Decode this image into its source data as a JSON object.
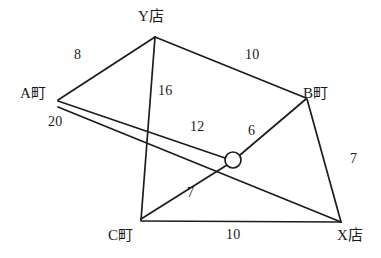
{
  "diagram": {
    "type": "weighted-graph",
    "title": "",
    "background_color": "#ffffff",
    "line_color": "#1c1c1c",
    "nodes": [
      {
        "id": "Y",
        "label": "Y店",
        "x": 155,
        "y": 37,
        "label_x": 138,
        "label_y": 9,
        "shape": "point"
      },
      {
        "id": "A",
        "label": "A町",
        "x": 58,
        "y": 100,
        "label_x": 20,
        "label_y": 86,
        "shape": "point"
      },
      {
        "id": "B",
        "label": "B町",
        "x": 306,
        "y": 98,
        "label_x": 303,
        "label_y": 86,
        "shape": "point"
      },
      {
        "id": "C",
        "label": "C町",
        "x": 141,
        "y": 220,
        "label_x": 108,
        "label_y": 228,
        "shape": "point"
      },
      {
        "id": "X",
        "label": "X店",
        "x": 341,
        "y": 222,
        "label_x": 337,
        "label_y": 228,
        "shape": "point"
      },
      {
        "id": "J",
        "label": "",
        "x": 233,
        "y": 160,
        "label_x": 0,
        "label_y": 0,
        "shape": "circle",
        "radius": 8
      }
    ],
    "edges": [
      {
        "id": "edge-a-y",
        "from": "A",
        "to": "Y",
        "weight": "8",
        "label_x": 74,
        "label_y": 48
      },
      {
        "id": "edge-y-b",
        "from": "Y",
        "to": "B",
        "weight": "10",
        "label_x": 245,
        "label_y": 48
      },
      {
        "id": "edge-y-c",
        "from": "Y",
        "to": "C",
        "weight": "16",
        "label_x": 158,
        "label_y": 84
      },
      {
        "id": "edge-a-j",
        "from": "A",
        "to": "J",
        "weight": "12",
        "label_x": 190,
        "label_y": 120
      },
      {
        "id": "edge-b-j",
        "from": "B",
        "to": "J",
        "weight": "6",
        "label_x": 248,
        "label_y": 124
      },
      {
        "id": "edge-b-x",
        "from": "B",
        "to": "X",
        "weight": "7",
        "label_x": 350,
        "label_y": 152
      },
      {
        "id": "edge-a-x",
        "from": "A",
        "to": "X",
        "weight": "20",
        "label_x": 48,
        "label_y": 115
      },
      {
        "id": "edge-c-j",
        "from": "C",
        "to": "J",
        "weight": "7",
        "label_x": 187,
        "label_y": 186
      },
      {
        "id": "edge-c-x",
        "from": "C",
        "to": "X",
        "weight": "10",
        "label_x": 226,
        "label_y": 228
      }
    ]
  }
}
